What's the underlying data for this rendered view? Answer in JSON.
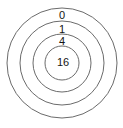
{
  "diagram": {
    "type": "concentric-rings",
    "background_color": "#ffffff",
    "stroke_color": "#6b6b6b",
    "text_color": "#141414",
    "center": {
      "x": 62,
      "y": 63
    },
    "rings": [
      {
        "id": "ring-outer",
        "label": "0",
        "radius": 55,
        "label_x": 62,
        "label_y": 16
      },
      {
        "id": "ring-second",
        "label": "1",
        "radius": 42,
        "label_x": 62,
        "label_y": 30
      },
      {
        "id": "ring-third",
        "label": "4",
        "radius": 29,
        "label_x": 62,
        "label_y": 42
      },
      {
        "id": "ring-center",
        "label": "16",
        "radius": 17,
        "label_x": 63,
        "label_y": 63
      }
    ]
  }
}
